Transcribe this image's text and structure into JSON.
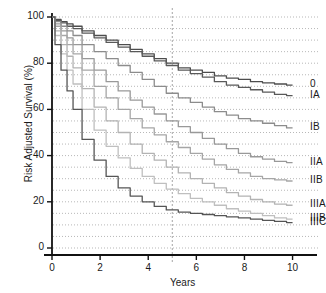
{
  "chart_data": {
    "type": "line",
    "title": "",
    "xlabel": "Years",
    "ylabel": "Risk Adjusted Survival (%)",
    "xlim": [
      0,
      10.6
    ],
    "ylim": [
      0,
      100
    ],
    "xticks": [
      "0",
      "2",
      "4",
      "6",
      "8",
      "10"
    ],
    "xtick_values": [
      0,
      2,
      4,
      6,
      8,
      10
    ],
    "yticks": [
      "0",
      "20",
      "40",
      "60",
      "80",
      "100"
    ],
    "ytick_values": [
      0,
      20,
      40,
      60,
      80,
      100
    ],
    "grid": "horizontal dotted minor gridlines every 5 units, vertical dotted reference line at year 5",
    "minor_gridline_step": 5,
    "reference_line_x": 5,
    "legend_position": "right of curve endpoints",
    "x": [
      0,
      0.25,
      0.5,
      0.75,
      1,
      1.5,
      2,
      2.5,
      3,
      3.5,
      4,
      4.5,
      5,
      5.5,
      6,
      6.5,
      7,
      7.5,
      8,
      8.5,
      9,
      9.5,
      10
    ],
    "series": [
      {
        "name": "0",
        "label": "0",
        "color": "#4d4d4d",
        "values": [
          100,
          99,
          98,
          97,
          96,
          94,
          92,
          90,
          88,
          86,
          84,
          82,
          80,
          78,
          77,
          76,
          74.5,
          73.5,
          73,
          72,
          71.5,
          71,
          70.5
        ]
      },
      {
        "name": "IA",
        "label": "IA",
        "color": "#595959",
        "values": [
          100,
          98.5,
          97.5,
          96,
          95,
          93,
          91,
          89,
          87,
          85,
          83,
          81,
          79,
          77,
          75.5,
          74,
          72,
          70.5,
          69.5,
          68.5,
          67.5,
          66.5,
          66
        ]
      },
      {
        "name": "IB",
        "label": "IB",
        "color": "#8c8c8c",
        "values": [
          100,
          98,
          96,
          94,
          92,
          88,
          85,
          82,
          79,
          76,
          73,
          70,
          67,
          65,
          63,
          61,
          59,
          57.5,
          56,
          55,
          54,
          53,
          52
        ]
      },
      {
        "name": "IIA",
        "label": "IIA",
        "color": "#999999",
        "values": [
          100,
          97,
          94,
          91,
          88,
          82,
          77,
          72,
          68,
          64,
          61,
          58,
          55,
          52.5,
          50,
          47.5,
          45,
          43,
          41,
          39.5,
          38.5,
          37.5,
          37
        ]
      },
      {
        "name": "IIB",
        "label": "IIB",
        "color": "#a6a6a6",
        "values": [
          100,
          96,
          92,
          88,
          84,
          77,
          70,
          65,
          60,
          56,
          52,
          49,
          46,
          43.5,
          41,
          38.5,
          36,
          34,
          32.5,
          31,
          30,
          29.5,
          29
        ]
      },
      {
        "name": "IIIA",
        "label": "IIIA",
        "color": "#b3b3b3",
        "values": [
          100,
          94,
          88,
          83,
          78,
          69,
          61,
          55,
          50,
          45,
          41,
          38,
          35,
          32.5,
          30,
          28,
          26,
          24,
          22.5,
          21,
          20,
          19,
          18.5
        ]
      },
      {
        "name": "IIIB",
        "label": "IIIB",
        "color": "#bfbfbf",
        "values": [
          100,
          92,
          84,
          77,
          71,
          60,
          51,
          44,
          39,
          34.5,
          31,
          28,
          25.5,
          23.5,
          21.5,
          20,
          18.5,
          17,
          16,
          15,
          14,
          13,
          12.5
        ]
      },
      {
        "name": "IIIC",
        "label": "IIIC",
        "color": "#555555",
        "values": [
          100,
          88,
          77,
          68,
          60,
          47,
          38,
          31,
          26,
          22.5,
          20,
          18,
          16.5,
          15.5,
          15,
          14.5,
          14,
          13.5,
          13,
          12.5,
          12,
          11.5,
          11
        ]
      }
    ]
  }
}
